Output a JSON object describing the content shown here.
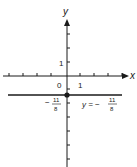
{
  "diagram": {
    "axes": {
      "x_label": "x",
      "y_label": "y",
      "origin_label": "0",
      "x_unit_label": "1",
      "y_unit_label": "1"
    },
    "line": {
      "equation_prefix": "y = −",
      "numerator": "11",
      "denominator": "8",
      "y_value": -1.375
    },
    "intercept": {
      "sign": "−",
      "numerator": "11",
      "denominator": "8"
    },
    "colors": {
      "ink": "#1a1a1a",
      "background": "#ffffff"
    }
  }
}
